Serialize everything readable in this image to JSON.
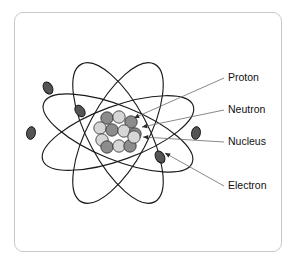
{
  "figure": {
    "background_color": "#ffffff",
    "frame_color": "#c9c9c9"
  },
  "labels": [
    {
      "id": "proton",
      "text": "Proton",
      "x": 228,
      "y": 78,
      "icon": "callout-label"
    },
    {
      "id": "neutron",
      "text": "Neutron",
      "x": 228,
      "y": 110,
      "icon": "callout-label"
    },
    {
      "id": "nucleus",
      "text": "Nucleus",
      "x": 228,
      "y": 142,
      "icon": "callout-label"
    },
    {
      "id": "electron",
      "text": "Electron",
      "x": 228,
      "y": 186,
      "icon": "callout-label"
    }
  ],
  "colors": {
    "proton": "#8c8c8c",
    "neutron": "#d6d6d6",
    "electron": "#555555",
    "orbit_stroke": "#1a1a1a",
    "leader_stroke": "#6b6b6b",
    "text": "#111111"
  },
  "nucleus": {
    "center_x": 118,
    "center_y": 133,
    "particle_radius": 6.2,
    "particle_count": 12,
    "particles": [
      {
        "type": "proton",
        "x": 107,
        "y": 118
      },
      {
        "type": "neutron",
        "x": 119,
        "y": 117
      },
      {
        "type": "proton",
        "x": 131,
        "y": 122
      },
      {
        "type": "neutron",
        "x": 100,
        "y": 128
      },
      {
        "type": "proton",
        "x": 112,
        "y": 130
      },
      {
        "type": "neutron",
        "x": 124,
        "y": 131
      },
      {
        "type": "proton",
        "x": 135,
        "y": 134
      },
      {
        "type": "neutron",
        "x": 102,
        "y": 140
      },
      {
        "type": "proton",
        "x": 107,
        "y": 147
      },
      {
        "type": "neutron",
        "x": 119,
        "y": 146
      },
      {
        "type": "proton",
        "x": 130,
        "y": 146
      },
      {
        "type": "neutron",
        "x": 134,
        "y": 137
      }
    ]
  },
  "orbits": [
    {
      "id": "orbit-1",
      "rx": 80,
      "ry": 27,
      "rotation": -20
    },
    {
      "id": "orbit-2",
      "rx": 80,
      "ry": 27,
      "rotation": 22
    },
    {
      "id": "orbit-3",
      "rx": 78,
      "ry": 30,
      "rotation": 62
    },
    {
      "id": "orbit-4",
      "rx": 78,
      "ry": 30,
      "rotation": -62
    }
  ],
  "electrons": [
    {
      "id": "electron-1",
      "x": 48,
      "y": 88,
      "rotation": -30
    },
    {
      "id": "electron-2",
      "x": 80,
      "y": 111,
      "rotation": -35
    },
    {
      "id": "electron-3",
      "x": 31,
      "y": 133,
      "rotation": 10
    },
    {
      "id": "electron-4",
      "x": 196,
      "y": 133,
      "rotation": 10
    },
    {
      "id": "electron-5",
      "x": 160,
      "y": 157,
      "rotation": -30
    }
  ],
  "callouts": [
    {
      "id": "proton-arrow",
      "from_x": 224,
      "from_y": 78,
      "to_x": 134,
      "to_y": 118
    },
    {
      "id": "neutron-arrow",
      "from_x": 224,
      "from_y": 110,
      "to_x": 142,
      "to_y": 127
    },
    {
      "id": "nucleus-arrow",
      "from_x": 224,
      "from_y": 142,
      "to_x": 143,
      "to_y": 137
    },
    {
      "id": "electron-arrow",
      "from_x": 224,
      "from_y": 186,
      "to_x": 165,
      "to_y": 153
    }
  ]
}
